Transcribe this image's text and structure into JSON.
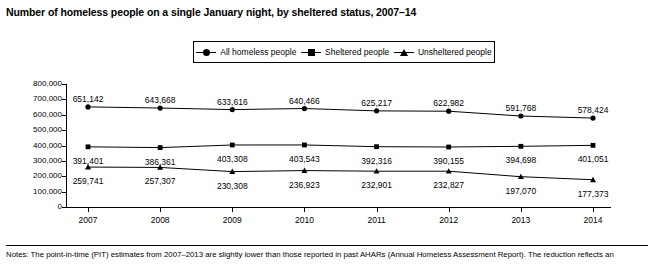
{
  "chart_data": {
    "type": "line",
    "title": "Number of homeless people on a single January night, by sheltered status, 2007–14",
    "xlabel": "",
    "ylabel": "",
    "categories": [
      "2007",
      "2008",
      "2009",
      "2010",
      "2011",
      "2012",
      "2013",
      "2014"
    ],
    "ylim": [
      0,
      800000
    ],
    "yticks": [
      0,
      100000,
      200000,
      300000,
      400000,
      500000,
      600000,
      700000,
      800000
    ],
    "ytick_labels": [
      "0",
      "100,000",
      "200,000",
      "300,000",
      "400,000",
      "500,000",
      "600,000",
      "700,000",
      "800,000"
    ],
    "grid": false,
    "legend_position": "top-center",
    "series": [
      {
        "name": "All homeless people",
        "marker": "circle",
        "values": [
          651142,
          643668,
          633616,
          640466,
          625217,
          622982,
          591768,
          578424
        ],
        "labels": [
          "651,142",
          "643,668",
          "633,616",
          "640,466",
          "625,217",
          "622,982",
          "591,768",
          "578,424"
        ]
      },
      {
        "name": "Sheltered people",
        "marker": "square",
        "values": [
          391401,
          386361,
          403308,
          403543,
          392316,
          390155,
          394698,
          401051
        ],
        "labels": [
          "391,401",
          "386,361",
          "403,308",
          "403,543",
          "392,316",
          "390,155",
          "394,698",
          "401,051"
        ]
      },
      {
        "name": "Unsheltered people",
        "marker": "triangle",
        "values": [
          259741,
          257307,
          230308,
          236923,
          232901,
          232827,
          197070,
          177373
        ],
        "labels": [
          "259,741",
          "257,307",
          "230,308",
          "236,923",
          "232,901",
          "232,827",
          "197,070",
          "177,373"
        ]
      }
    ]
  },
  "footnote": {
    "text": "Notes: The point-in-time (PIT) estimates from 2007–2013 are slightly lower than those reported in past AHARs (Annual Homeless Assessment Report). The reduction reflects an"
  }
}
